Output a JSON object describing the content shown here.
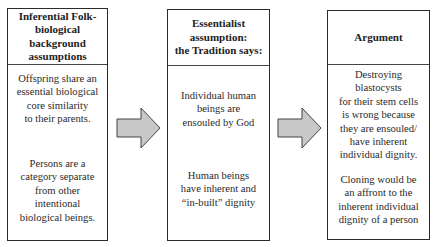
{
  "diagram": {
    "boxes": [
      {
        "header": "Inferential Folk-\nbiological\nbackground\nassumptions",
        "paragraphs": [
          "Offspring share an\nessential biological\ncore similarity\nto their parents.",
          "Persons are a\ncategory separate\nfrom other\nintentional\nbiological beings."
        ]
      },
      {
        "header": "Essentialist\nassumption:\nthe Tradition says:",
        "paragraphs": [
          "Individual human\nbeings are\nensouled by God",
          "Human beings\nhave inherent and\n“in-built” dignity"
        ]
      },
      {
        "header": "Argument",
        "paragraphs": [
          "Destroying\nblastocysts\nfor their stem cells\nis wrong because\nthey are ensouled/\nhave inherent\nindividual dignity.",
          "Cloning would be\nan affront to the\ninherent individual\ndignity of a person"
        ]
      }
    ],
    "arrows": [
      {
        "from": "box-1",
        "to": "box-2",
        "fill": "#c8c8c8",
        "stroke": "#444444"
      },
      {
        "from": "box-2",
        "to": "box-3",
        "fill": "#c8c8c8",
        "stroke": "#444444"
      }
    ]
  }
}
